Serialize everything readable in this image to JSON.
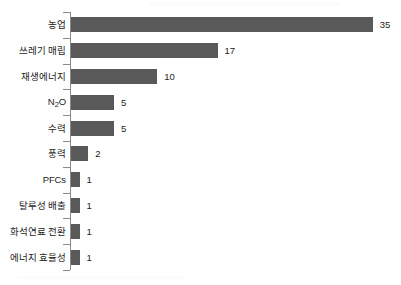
{
  "chart_data": {
    "type": "bar",
    "orientation": "horizontal",
    "title": "",
    "subtitle": "",
    "xlabel": "",
    "ylabel": "",
    "grid": false,
    "legend": false,
    "legend_position": "none",
    "xlim": [
      0,
      38
    ],
    "bar_color": "#595959",
    "axis_color": "#8a8a8a",
    "label_color": "#1c1c1c",
    "background_color": "#ffffff",
    "categories": [
      "농업",
      "쓰레기 매립",
      "재생에너지",
      "N₂O",
      "수력",
      "풍력",
      "PFCs",
      "탈루성 배출",
      "화석연료 전환",
      "에너지 효율성"
    ],
    "values": [
      35,
      17,
      10,
      5,
      5,
      2,
      1,
      1,
      1,
      1
    ],
    "value_labels": [
      "35",
      "17",
      "10",
      "5",
      "5",
      "2",
      "1",
      "1",
      "1",
      "1"
    ],
    "items": [
      {
        "label": "농업",
        "value": 35,
        "value_label": "35",
        "label_html": "농업"
      },
      {
        "label": "쓰레기 매립",
        "value": 17,
        "value_label": "17",
        "label_html": "쓰레기 매립"
      },
      {
        "label": "재생에너지",
        "value": 10,
        "value_label": "10",
        "label_html": "재생에너지"
      },
      {
        "label": "N₂O",
        "value": 5,
        "value_label": "5",
        "label_html": "N<sub>2</sub>O"
      },
      {
        "label": "수력",
        "value": 5,
        "value_label": "5",
        "label_html": "수력"
      },
      {
        "label": "풍력",
        "value": 2,
        "value_label": "2",
        "label_html": "풍력"
      },
      {
        "label": "PFCs",
        "value": 1,
        "value_label": "1",
        "label_html": "PFCs"
      },
      {
        "label": "탈루성 배출",
        "value": 1,
        "value_label": "1",
        "label_html": "탈루성 배출"
      },
      {
        "label": "화석연료 전환",
        "value": 1,
        "value_label": "1",
        "label_html": "화석연료 전환"
      },
      {
        "label": "에너지 효율성",
        "value": 1,
        "value_label": "1",
        "label_html": "에너지 효율성"
      }
    ]
  }
}
